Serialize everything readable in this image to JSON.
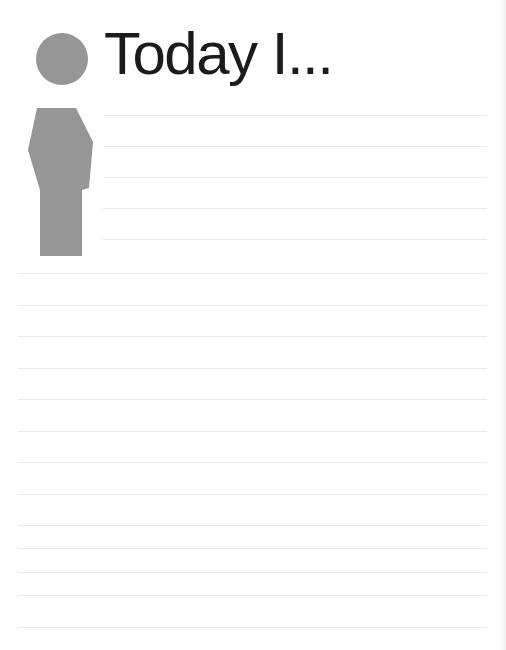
{
  "document": {
    "type": "journal-worksheet-page",
    "title": "Today I...",
    "icon": {
      "name": "person-silhouette-icon",
      "color": "#969696",
      "description": "gray person figure: circular head above tapered hexagonal body"
    },
    "writing_area": {
      "rule_color": "#e9e9ec",
      "line_spacing_px": 31,
      "indented_line_count": 6,
      "full_width_line_count": 12,
      "total_line_count": 18,
      "lines": [
        {
          "index": 1,
          "style": "indented",
          "y": 115,
          "text": ""
        },
        {
          "index": 2,
          "style": "indented",
          "y": 146,
          "text": ""
        },
        {
          "index": 3,
          "style": "indented",
          "y": 177,
          "text": ""
        },
        {
          "index": 4,
          "style": "indented",
          "y": 208,
          "text": ""
        },
        {
          "index": 5,
          "style": "indented",
          "y": 239,
          "text": ""
        },
        {
          "index": 6,
          "style": "full-width",
          "y": 273,
          "text": ""
        },
        {
          "index": 7,
          "style": "full-width",
          "y": 305,
          "text": ""
        },
        {
          "index": 8,
          "style": "full-width",
          "y": 336,
          "text": ""
        },
        {
          "index": 9,
          "style": "full-width",
          "y": 368,
          "text": ""
        },
        {
          "index": 10,
          "style": "full-width",
          "y": 399,
          "text": ""
        },
        {
          "index": 11,
          "style": "full-width",
          "y": 431,
          "text": ""
        },
        {
          "index": 12,
          "style": "full-width",
          "y": 462,
          "text": ""
        },
        {
          "index": 13,
          "style": "full-width",
          "y": 494,
          "text": ""
        },
        {
          "index": 14,
          "style": "full-width",
          "y": 525,
          "text": ""
        },
        {
          "index": 15,
          "style": "full-width",
          "y": 548,
          "text": ""
        },
        {
          "index": 16,
          "style": "full-width",
          "y": 572,
          "text": ""
        },
        {
          "index": 17,
          "style": "full-width",
          "y": 595,
          "text": ""
        },
        {
          "index": 18,
          "style": "full-width",
          "y": 627,
          "text": ""
        }
      ]
    },
    "colors": {
      "page_background": "#ffffff",
      "title_text": "#1b1b1b",
      "figure_gray": "#969696",
      "rule_gray": "#e9e9ec"
    }
  }
}
